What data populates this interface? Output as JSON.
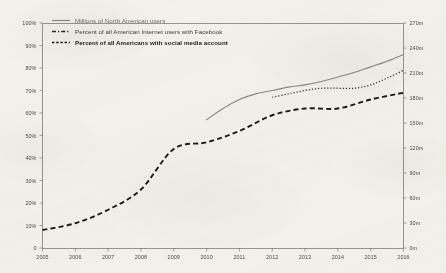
{
  "chart_data": {
    "type": "line",
    "title": "",
    "subtitle": "",
    "xlabel": "",
    "ylabel": "",
    "y2label": "",
    "grid": false,
    "legend_position": "top-left",
    "x": [
      2005,
      2006,
      2007,
      2008,
      2009,
      2010,
      2011,
      2012,
      2013,
      2014,
      2015,
      2016
    ],
    "xticklabels": [
      "2005",
      "2006",
      "2007",
      "2008",
      "2009",
      "2010",
      "2011",
      "2012",
      "2013",
      "2014",
      "2015",
      "2016"
    ],
    "ylim": [
      0,
      100
    ],
    "yticks": [
      0,
      10,
      20,
      30,
      40,
      50,
      60,
      70,
      80,
      90,
      100
    ],
    "yticklabels": [
      "0",
      "10%",
      "20%",
      "30%",
      "40%",
      "50%",
      "60%",
      "70%",
      "80%",
      "90%",
      "100%"
    ],
    "y2lim": [
      0,
      270
    ],
    "y2ticks": [
      0,
      30,
      60,
      90,
      120,
      150,
      180,
      210,
      240,
      270
    ],
    "y2ticklabels": [
      "0m",
      "30m",
      "60m",
      "90m",
      "120m",
      "150m",
      "180m",
      "210m",
      "240m",
      "270m"
    ],
    "series": [
      {
        "name": "Millions of North American users",
        "style": "solid",
        "color": "#8a8a84",
        "axis": "right",
        "x": [
          2010,
          2010.5,
          2011,
          2011.5,
          2012,
          2012.5,
          2013,
          2013.5,
          2014,
          2014.5,
          2015,
          2015.5,
          2016
        ],
        "values_percent_scale": [
          57,
          62,
          66,
          68.5,
          70,
          71.5,
          72.5,
          74,
          76,
          78,
          80.5,
          83,
          86
        ],
        "values_millions": [
          154,
          167,
          178,
          185,
          189,
          193,
          196,
          200,
          205,
          211,
          217,
          224,
          232
        ]
      },
      {
        "name": "Percent of all American Internet users with Facebook",
        "style": "dotted-fine",
        "color": "#2a2a28",
        "axis": "left",
        "x": [
          2012,
          2012.5,
          2013,
          2013.5,
          2014,
          2014.5,
          2015,
          2015.5,
          2016
        ],
        "values": [
          67,
          68.5,
          70,
          71,
          71,
          71,
          72.5,
          75.5,
          79
        ]
      },
      {
        "name": "Percent of all Americans with social media account",
        "style": "dashed-bold",
        "color": "#1a1a18",
        "axis": "left",
        "x": [
          2005,
          2006,
          2007,
          2008,
          2009,
          2010,
          2011,
          2012,
          2013,
          2014,
          2015,
          2016
        ],
        "values": [
          8,
          11,
          17,
          26,
          44,
          47,
          52,
          59,
          62,
          62,
          66,
          69
        ]
      }
    ],
    "legend": [
      {
        "label": "Millions of North American users",
        "style": "solid",
        "emphasis": "faint"
      },
      {
        "label": "Percent of all American Internet users with Facebook",
        "style": "dash-dot",
        "emphasis": "normal"
      },
      {
        "label": "Percent of all Americans with social media account",
        "style": "dotted",
        "emphasis": "bold"
      }
    ]
  }
}
